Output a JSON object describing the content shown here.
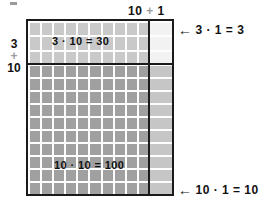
{
  "diagram": {
    "type": "area-model",
    "speck_icon": "artifact-speck-icon",
    "top_dimension": {
      "first": "10",
      "operator": "+",
      "second": "1"
    },
    "left_dimension": {
      "first": "3",
      "operator": "+",
      "second": "10"
    },
    "regions": [
      {
        "name": "top-left",
        "label": "3 · 10 = 30",
        "factor_a": 3,
        "factor_b": 10,
        "product": 30,
        "rows": 3,
        "cols": 10,
        "fill": "#c9c9c9"
      },
      {
        "name": "top-right",
        "label": "3 · 1 = 3",
        "factor_a": 3,
        "factor_b": 1,
        "product": 3,
        "rows": 3,
        "cols": 1,
        "fill": "#f2f2f2"
      },
      {
        "name": "bottom-left",
        "label": "10 · 10 = 100",
        "factor_a": 10,
        "factor_b": 10,
        "product": 100,
        "rows": 10,
        "cols": 10,
        "fill": "#a0a0a0"
      },
      {
        "name": "bottom-right",
        "label": "10 · 1 = 10",
        "factor_a": 10,
        "factor_b": 1,
        "product": 10,
        "rows": 10,
        "cols": 1,
        "fill": "#c6c6c6"
      }
    ],
    "callouts": [
      {
        "arrow": "←",
        "arrow_icon": "arrow-left-icon",
        "text": "3 · 1 = 3"
      },
      {
        "arrow": "←",
        "arrow_icon": "arrow-left-icon",
        "text": "10 · 1 = 10"
      }
    ],
    "colors": {
      "outline": "#1a1a1a",
      "gridline": "#fdfdfd",
      "dim_text": "#9b9b9b",
      "text": "#111111",
      "background": "#ffffff"
    }
  }
}
